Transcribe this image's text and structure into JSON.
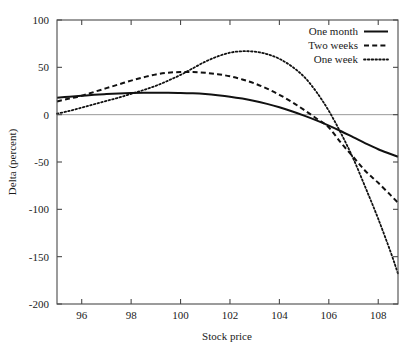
{
  "chart_data": {
    "type": "line",
    "title": "",
    "xlabel": "Stock price",
    "ylabel": "Delta (percent)",
    "xlim": [
      95.0,
      108.8
    ],
    "ylim": [
      -200,
      100
    ],
    "xticks": [
      96,
      98,
      100,
      102,
      104,
      106,
      108
    ],
    "yticks": [
      100,
      50,
      0,
      -50,
      -100,
      -150,
      -200
    ],
    "xtick_labels": [
      "96",
      "98",
      "100",
      "102",
      "104",
      "106",
      "108"
    ],
    "ytick_labels": [
      "100",
      "50",
      "0",
      "-50",
      "-100",
      "-150",
      "-200"
    ],
    "grid": false,
    "zero_line": true,
    "legend_position": "top-right",
    "series": [
      {
        "name": "One month",
        "style": "solid",
        "color": "#111111",
        "x": [
          95.0,
          95.5,
          96.0,
          96.5,
          97.0,
          97.5,
          98.0,
          98.5,
          99.0,
          99.5,
          100.0,
          100.5,
          101.0,
          101.5,
          102.0,
          102.5,
          103.0,
          103.5,
          104.0,
          104.5,
          105.0,
          105.5,
          106.0,
          106.5,
          107.0,
          107.5,
          108.0,
          108.5,
          108.8
        ],
        "y": [
          18,
          19,
          20,
          21,
          21.8,
          22.4,
          22.8,
          23.1,
          23.2,
          23.2,
          23.0,
          22.5,
          21.7,
          20.5,
          19.0,
          17.0,
          14.5,
          11.4,
          7.8,
          3.6,
          -1.0,
          -6.0,
          -11.5,
          -17.5,
          -24.0,
          -30.5,
          -36.5,
          -41.5,
          -44.5
        ]
      },
      {
        "name": "Two weeks",
        "style": "dashed",
        "color": "#111111",
        "x": [
          95.0,
          95.5,
          96.0,
          96.5,
          97.0,
          97.5,
          98.0,
          98.5,
          99.0,
          99.5,
          100.0,
          100.5,
          101.0,
          101.5,
          102.0,
          102.5,
          103.0,
          103.5,
          104.0,
          104.5,
          105.0,
          105.5,
          106.0,
          106.5,
          107.0,
          107.5,
          108.0,
          108.5,
          108.8
        ],
        "y": [
          14,
          17,
          20,
          24,
          28,
          32,
          36,
          39.5,
          42.5,
          44.3,
          45.0,
          45.0,
          44.2,
          42.8,
          40.5,
          37.2,
          33.0,
          27.5,
          21.0,
          13.5,
          5.0,
          -4.0,
          -13.5,
          -30.0,
          -45.0,
          -60.0,
          -72.0,
          -85.0,
          -93.0
        ]
      },
      {
        "name": "One week",
        "style": "dotted",
        "color": "#111111",
        "x": [
          95.0,
          95.5,
          96.0,
          96.5,
          97.0,
          97.5,
          98.0,
          98.5,
          99.0,
          99.5,
          100.0,
          100.5,
          101.0,
          101.5,
          102.0,
          102.5,
          103.0,
          103.5,
          104.0,
          104.5,
          105.0,
          105.5,
          106.0,
          106.5,
          107.0,
          107.5,
          108.0,
          108.5,
          108.8
        ],
        "y": [
          1,
          4,
          7.5,
          11,
          14.5,
          18,
          22,
          26,
          30.5,
          36,
          42,
          49,
          56,
          61.5,
          65.5,
          67.0,
          66.5,
          64.0,
          59.0,
          51.0,
          40.0,
          24.0,
          4.0,
          -20.0,
          -47.0,
          -78.0,
          -110.0,
          -145.0,
          -168.0
        ]
      }
    ]
  },
  "legend": {
    "items": [
      {
        "label": "One month",
        "style": "solid"
      },
      {
        "label": "Two weeks",
        "style": "dashed"
      },
      {
        "label": "One week",
        "style": "dotted"
      }
    ]
  }
}
